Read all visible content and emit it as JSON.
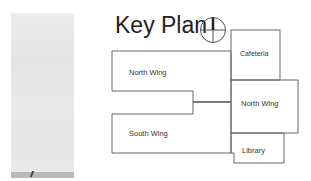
{
  "title": "Key Plan",
  "compass": {
    "icon": "north-arrow-compass-icon"
  },
  "rooms": [
    {
      "id": "north-wing-left",
      "label": "North Wing"
    },
    {
      "id": "cafeteria",
      "label": "Cafeteria"
    },
    {
      "id": "north-wing-right",
      "label": "North Wing"
    },
    {
      "id": "south-wing",
      "label": "South Wing"
    },
    {
      "id": "library",
      "label": "Library"
    }
  ],
  "colors": {
    "line": "#555555",
    "text": "#333333"
  }
}
